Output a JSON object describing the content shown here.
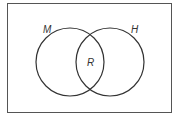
{
  "diagram": {
    "type": "venn",
    "sets": [
      {
        "id": "left",
        "label": "M"
      },
      {
        "id": "right",
        "label": "H"
      }
    ],
    "intersection": {
      "label": "R"
    },
    "colors": {
      "stroke": "#3a3a3a",
      "background": "#ffffff"
    }
  }
}
